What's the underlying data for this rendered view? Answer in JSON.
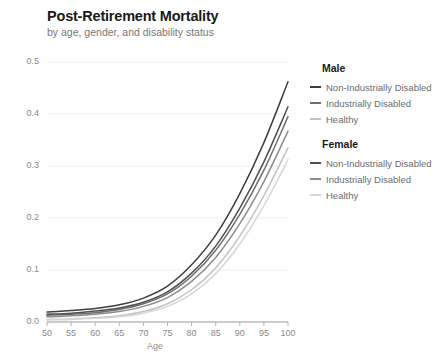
{
  "header": {
    "title": "Post-Retirement Mortality",
    "subtitle": "by age, gender, and disability status"
  },
  "chart_data": {
    "type": "line",
    "title": "Post-Retirement Mortality",
    "subtitle": "by age, gender, and disability status",
    "xlabel": "Age",
    "ylabel": "",
    "xlim": [
      50,
      100
    ],
    "ylim": [
      0,
      0.5
    ],
    "xticks": [
      50,
      55,
      60,
      65,
      70,
      75,
      80,
      85,
      90,
      95,
      100
    ],
    "yticks": [
      0.0,
      0.1,
      0.2,
      0.3,
      0.4,
      0.5
    ],
    "ytick_labels": [
      "0.0",
      "0.1",
      "0.2",
      "0.3",
      "0.4",
      "0.5"
    ],
    "grid": "horizontal",
    "legend_position": "right",
    "x": [
      50,
      55,
      60,
      65,
      70,
      75,
      80,
      85,
      90,
      95,
      100
    ],
    "series": [
      {
        "name": "Male Non-Industrially Disabled",
        "group": "Male",
        "label": "Non-Industrially Disabled",
        "color": "#3f3f3f",
        "values": [
          0.019,
          0.022,
          0.026,
          0.033,
          0.046,
          0.069,
          0.11,
          0.167,
          0.247,
          0.345,
          0.462
        ]
      },
      {
        "name": "Male Industrially Disabled",
        "group": "Male",
        "label": "Industrially Disabled",
        "color": "#6e6e6e",
        "values": [
          0.013,
          0.015,
          0.018,
          0.024,
          0.035,
          0.054,
          0.088,
          0.138,
          0.207,
          0.292,
          0.395
        ]
      },
      {
        "name": "Male Healthy",
        "group": "Male",
        "label": "Healthy",
        "color": "#c2c2c2",
        "values": [
          0.005,
          0.006,
          0.008,
          0.012,
          0.02,
          0.035,
          0.062,
          0.104,
          0.165,
          0.243,
          0.335
        ]
      },
      {
        "name": "Female Non-Industrially Disabled",
        "group": "Female",
        "label": "Non-Industrially Disabled",
        "color": "#4f4f4f",
        "values": [
          0.015,
          0.017,
          0.021,
          0.027,
          0.038,
          0.058,
          0.094,
          0.146,
          0.219,
          0.308,
          0.414
        ]
      },
      {
        "name": "Female Industrially Disabled",
        "group": "Female",
        "label": "Industrially Disabled",
        "color": "#8c8c8c",
        "values": [
          0.01,
          0.012,
          0.015,
          0.02,
          0.03,
          0.047,
          0.078,
          0.124,
          0.189,
          0.27,
          0.367
        ]
      },
      {
        "name": "Female Healthy",
        "group": "Female",
        "label": "Healthy",
        "color": "#d6d6d6",
        "values": [
          0.004,
          0.005,
          0.007,
          0.01,
          0.017,
          0.03,
          0.054,
          0.093,
          0.15,
          0.224,
          0.312
        ]
      }
    ]
  },
  "legend": {
    "groups": [
      {
        "header": "Male",
        "items": [
          {
            "label": "Non-Industrially Disabled",
            "color": "#3f3f3f"
          },
          {
            "label": "Industrially Disabled",
            "color": "#6e6e6e"
          },
          {
            "label": "Healthy",
            "color": "#c2c2c2"
          }
        ]
      },
      {
        "header": "Female",
        "items": [
          {
            "label": "Non-Industrially Disabled",
            "color": "#4f4f4f"
          },
          {
            "label": "Industrially Disabled",
            "color": "#8c8c8c"
          },
          {
            "label": "Healthy",
            "color": "#d6d6d6"
          }
        ]
      }
    ]
  }
}
